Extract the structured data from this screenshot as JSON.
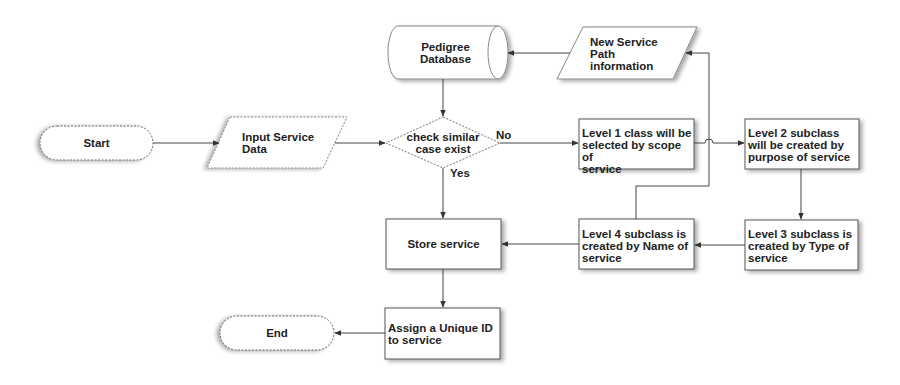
{
  "diagram": {
    "type": "flowchart",
    "nodes": {
      "start": {
        "label": "Start",
        "shape": "terminator"
      },
      "input": {
        "label": "Input Service Data",
        "line1": "Input Service",
        "line2": "Data",
        "shape": "parallelogram"
      },
      "pedigree": {
        "label": "Pedigree Database",
        "line1": "Pedigree",
        "line2": "Database",
        "shape": "cylinder"
      },
      "newpath": {
        "label": "New Service Path information",
        "line1": "New Service",
        "line2": "Path",
        "line3": "information",
        "shape": "parallelogram"
      },
      "decision": {
        "label": "check similar case exist",
        "line1": "check similar",
        "line2": "case exist",
        "shape": "diamond"
      },
      "level1": {
        "label": "Level 1 class will be selected by scope of service",
        "line1": "Level 1 class will be",
        "line2": "selected by scope of",
        "line3": "service",
        "shape": "process"
      },
      "level2": {
        "label": "Level 2 subclass will be created by purpose of service",
        "line1": "Level 2 subclass",
        "line2": "will be created by",
        "line3": "purpose of service",
        "shape": "process"
      },
      "level3": {
        "label": "Level 3 subclass is created by Type of service",
        "line1": "Level 3 subclass is",
        "line2": "created by Type of",
        "line3": "service",
        "shape": "process"
      },
      "level4": {
        "label": "Level 4 subclass is created by Name of service",
        "line1": "Level 4 subclass is",
        "line2": "created by Name of",
        "line3": "service",
        "shape": "process"
      },
      "store": {
        "label": "Store service",
        "shape": "process"
      },
      "assign": {
        "label": "Assign a Unique ID to service",
        "line1": "Assign a Unique ID",
        "line2": "to service",
        "shape": "process"
      },
      "end": {
        "label": "End",
        "shape": "terminator"
      }
    },
    "edge_labels": {
      "no": "No",
      "yes": "Yes"
    },
    "edges": [
      {
        "from": "start",
        "to": "input"
      },
      {
        "from": "input",
        "to": "decision"
      },
      {
        "from": "pedigree",
        "to": "decision"
      },
      {
        "from": "decision",
        "to": "level1",
        "label": "No"
      },
      {
        "from": "decision",
        "to": "store",
        "label": "Yes"
      },
      {
        "from": "level1",
        "to": "level2"
      },
      {
        "from": "level2",
        "to": "level3"
      },
      {
        "from": "level3",
        "to": "level4"
      },
      {
        "from": "level4",
        "to": "store"
      },
      {
        "from": "level4",
        "to": "newpath"
      },
      {
        "from": "newpath",
        "to": "pedigree"
      },
      {
        "from": "store",
        "to": "assign"
      },
      {
        "from": "assign",
        "to": "end"
      }
    ],
    "colors": {
      "stroke": "#444444",
      "dashed_stroke": "#777777",
      "fill": "#ffffff",
      "shadow": "#bbbbbb",
      "text": "#222222"
    }
  }
}
